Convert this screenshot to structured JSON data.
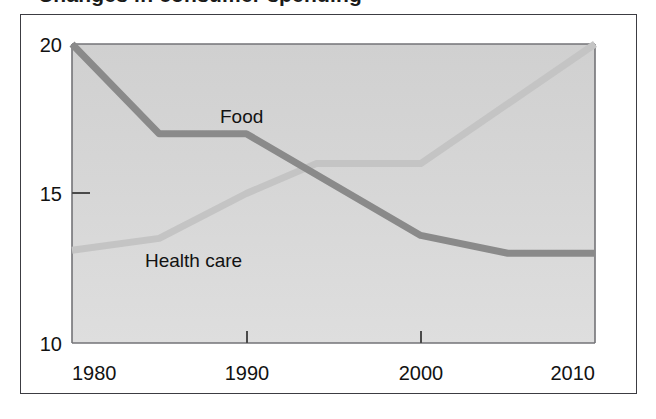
{
  "figure": {
    "title_clipped": "Changes in consumer spending",
    "outer_border_color": "#3c3c42",
    "page_background": "#ffffff"
  },
  "plot": {
    "background_top_color": "#d2d2d2",
    "background_bottom_color": "#dcdcdc",
    "frame_color": "#6e6e72",
    "tick_color": "#4a4a4a"
  },
  "chart_data": {
    "type": "line",
    "title": "Changes in consumer spending",
    "xlabel": "",
    "ylabel": "",
    "xlim": [
      1980,
      2010
    ],
    "ylim": [
      10,
      20
    ],
    "xticks": [
      "1980",
      "1990",
      "2000",
      "2010"
    ],
    "yticks": [
      "20",
      "15",
      "10"
    ],
    "grid": false,
    "legend_position": "inline-annotation",
    "series": [
      {
        "name": "Food",
        "color": "#8a8a8a",
        "label_x": 1992.6,
        "label_y": 18.35,
        "x": [
          1980,
          1985,
          1990,
          2000,
          2005,
          2010
        ],
        "values": [
          20.0,
          17.0,
          17.0,
          13.6,
          13.0,
          13.0
        ]
      },
      {
        "name": "Health care",
        "color": "#c4c4c4",
        "label_x": 1986.0,
        "label_y": 13.2,
        "x": [
          1980,
          1985,
          1990,
          1994,
          2000,
          2010
        ],
        "values": [
          13.1,
          13.5,
          15.0,
          16.0,
          16.0,
          20.0
        ]
      }
    ],
    "annotations": [
      {
        "text": "Food",
        "x": 1992.6,
        "y": 18.35
      },
      {
        "text": "Health care",
        "x": 1986.0,
        "y": 13.2
      }
    ]
  }
}
